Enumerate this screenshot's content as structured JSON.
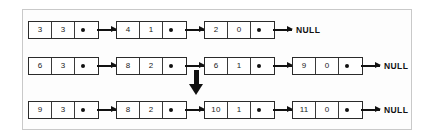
{
  "figure": {
    "null_label": "NULL",
    "transition_arrow": "down-arrow",
    "rows": [
      {
        "name": "polynomial-1",
        "nodes": [
          {
            "coefficient": "3",
            "exponent": "3",
            "pointer": "next"
          },
          {
            "coefficient": "4",
            "exponent": "1",
            "pointer": "next"
          },
          {
            "coefficient": "2",
            "exponent": "0",
            "pointer": "null"
          }
        ],
        "terminator": "NULL"
      },
      {
        "name": "polynomial-2",
        "nodes": [
          {
            "coefficient": "6",
            "exponent": "3",
            "pointer": "next"
          },
          {
            "coefficient": "8",
            "exponent": "2",
            "pointer": "next"
          },
          {
            "coefficient": "6",
            "exponent": "1",
            "pointer": "next"
          },
          {
            "coefficient": "9",
            "exponent": "0",
            "pointer": "null"
          }
        ],
        "terminator": "NULL"
      },
      {
        "name": "polynomial-result",
        "nodes": [
          {
            "coefficient": "9",
            "exponent": "3",
            "pointer": "next"
          },
          {
            "coefficient": "8",
            "exponent": "2",
            "pointer": "next"
          },
          {
            "coefficient": "10",
            "exponent": "1",
            "pointer": "next"
          },
          {
            "coefficient": "11",
            "exponent": "0",
            "pointer": "null"
          }
        ],
        "terminator": "NULL"
      }
    ],
    "colors": {
      "node_border": "#2b2b2b",
      "arrow": "#111111",
      "frame_border": "#c9c9c9",
      "background": "#fdfdfd"
    }
  },
  "layout": {
    "node_x": [
      5,
      93,
      181,
      269
    ],
    "row_y": [
      11,
      47,
      91
    ],
    "node_width": 69,
    "cell_width": 23,
    "down_arrow": {
      "x": 164,
      "y": 60
    }
  }
}
